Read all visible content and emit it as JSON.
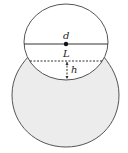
{
  "diagram": {
    "labels": {
      "diameter": "d",
      "chord": "L",
      "height": "h"
    },
    "colors": {
      "stroke": "#555555",
      "fill_lower": "#ececec",
      "fill_upper": "#ffffff",
      "point": "#111111"
    }
  }
}
